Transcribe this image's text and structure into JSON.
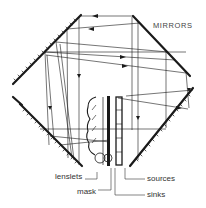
{
  "diagram": {
    "title": "MIRRORS",
    "labels": {
      "lenslets": "lenslets",
      "mask": "mask",
      "sources": "sources",
      "sinks": "sinks"
    },
    "colors": {
      "ink": "#1a1a1a",
      "text": "#333333",
      "background": "#ffffff"
    }
  }
}
